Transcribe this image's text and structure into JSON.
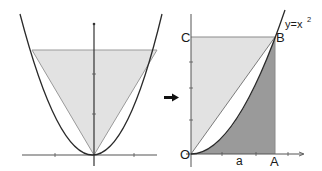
{
  "diagram": {
    "colors": {
      "background": "#ffffff",
      "axis": "#333333",
      "curve": "#2a2a2a",
      "light_fill": "#e2e2e2",
      "dark_fill": "#9a9a9a",
      "edge": "#8a8a8a",
      "arrow": "#111111"
    },
    "left_panel": {
      "curve": "parabola",
      "shaded_shape": "inverted triangle inscribed between parabola arms"
    },
    "arrow_icon": "right-arrow",
    "right_panel": {
      "labels": {
        "point_c": "C",
        "point_b": "B",
        "point_o": "O",
        "point_a": "A",
        "x_label": "a",
        "curve_label_base": "y=x",
        "curve_label_exp": "2"
      },
      "regions": [
        {
          "name": "triangle-OBC",
          "shade": "light"
        },
        {
          "name": "between-chord-and-curve",
          "shade": "white"
        },
        {
          "name": "under-curve-OAB",
          "shade": "dark"
        }
      ]
    }
  }
}
